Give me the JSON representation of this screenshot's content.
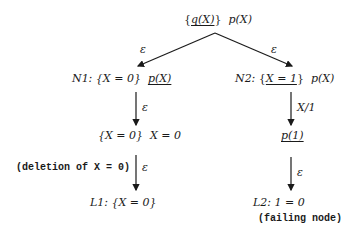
{
  "diagram": {
    "type": "derivation-tree",
    "root": {
      "goal_set": "{q(X)}",
      "goal_set_underlined": "q(X)",
      "goal": "p(X)"
    },
    "edges": {
      "root_to_n1": "ε",
      "root_to_n2": "ε",
      "n1_to_n1a": "ε",
      "n1a_to_l1": "ε",
      "n1a_to_l1_note": "(deletion of X = 0)",
      "n2_to_n2a": "X/1",
      "n2a_to_l2": "ε"
    },
    "nodes": {
      "n1": {
        "name": "N1:",
        "constraint": "{X = 0}",
        "goal": "p(X)",
        "goal_underlined": true
      },
      "n1a": {
        "constraint": "{X = 0}",
        "goal": "X = 0"
      },
      "l1": {
        "name": "L1:",
        "constraint": "{X = 0}"
      },
      "n2": {
        "name": "N2:",
        "constraint_open": "{",
        "constraint_inner": "X = 1",
        "constraint_close": "}",
        "goal": "p(X)"
      },
      "n2a": {
        "goal": "p(1)",
        "goal_underlined": true
      },
      "l2": {
        "name": "L2:",
        "goal": "1 = 0",
        "note": "(failing node)"
      }
    }
  }
}
